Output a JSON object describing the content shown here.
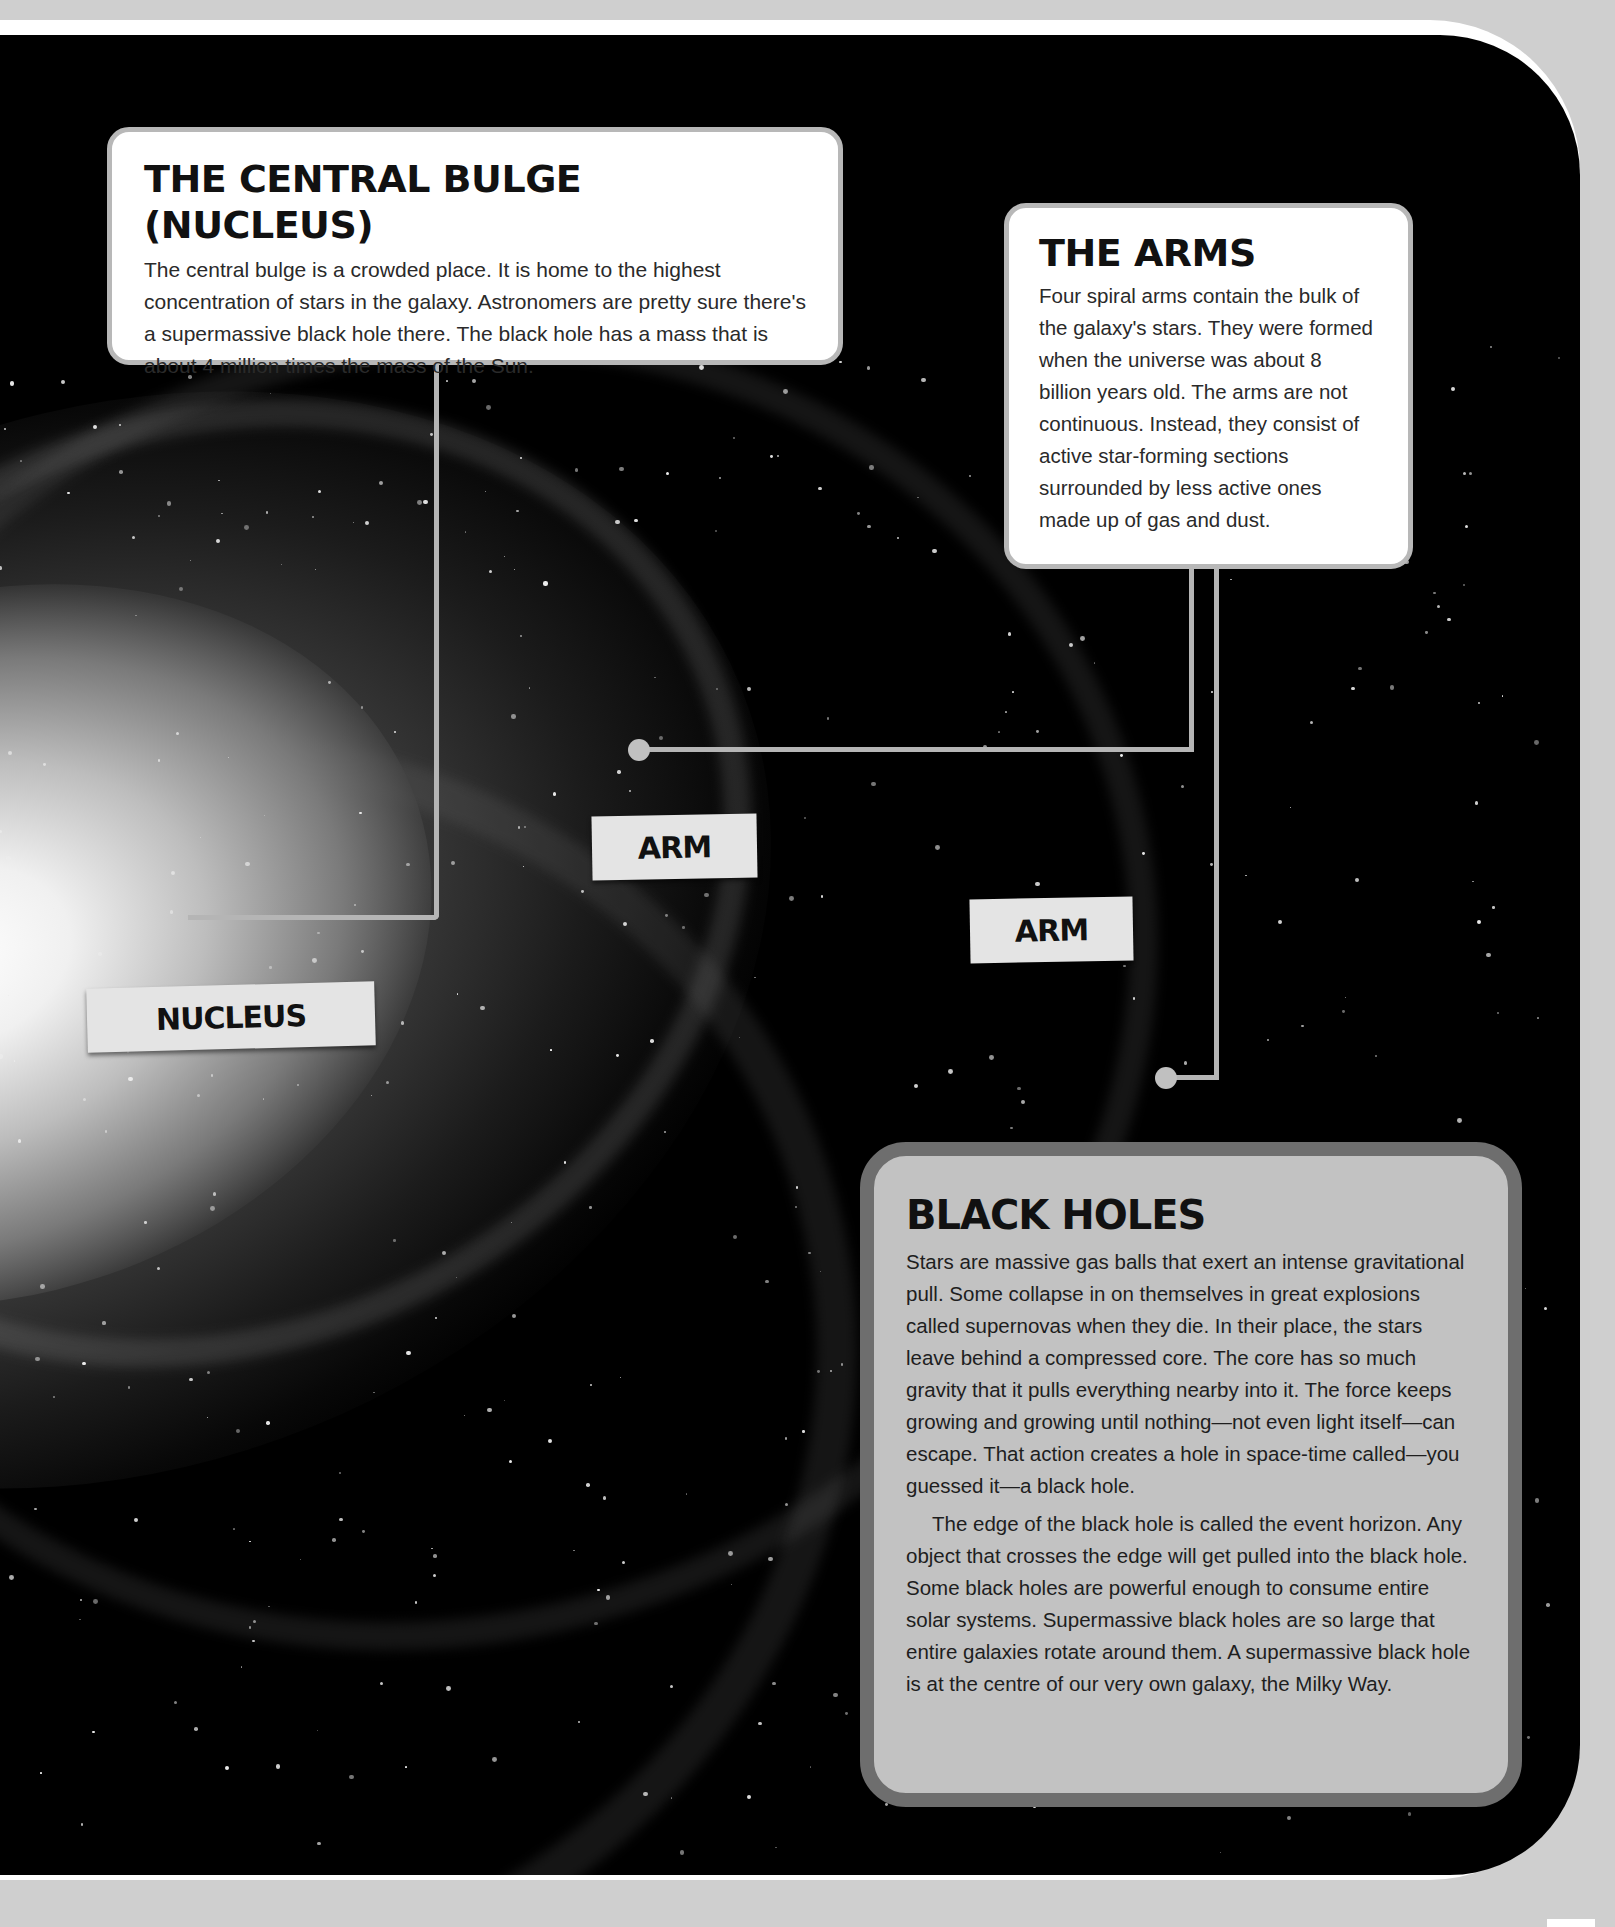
{
  "page": {
    "background_color": "#cfcfcf",
    "space_color": "#000000",
    "frame_color": "#ffffff"
  },
  "central_bulge": {
    "title": "THE CENTRAL BULGE (NUCLEUS)",
    "body": "The central bulge is a crowded place. It is home to the highest concentration of stars in the galaxy. Astronomers are pretty sure there's a supermassive black hole there. The black hole has a mass that is about 4 million times the mass of the Sun."
  },
  "arms": {
    "title": "THE ARMS",
    "body": "Four spiral arms contain the bulk of the galaxy's stars. They were formed when the universe was about 8 billion years old. The arms are not continuous. Instead, they consist of active star-forming sections surrounded by less active ones made up of gas and dust."
  },
  "black_holes": {
    "title": "BLACK HOLES",
    "paragraph_1": "Stars are massive gas balls that exert an intense gravitational pull. Some collapse in on themselves in great explosions called supernovas when they die. In their place, the stars leave behind a compressed core. The core has so much gravity that it pulls everything nearby into it. The force keeps growing and growing until nothing—not even light itself—can escape. That action creates a hole in space-time called—you guessed it—a black hole.",
    "paragraph_2": "The edge of the black hole is called the event horizon. Any object that crosses the edge will get pulled into the black hole. Some black holes are powerful enough to consume entire solar systems. Supermassive black holes are so large that entire galaxies rotate around them. A supermassive black hole is at the centre of our very own galaxy, the Milky Way.",
    "panel_color": "#c2c2c2",
    "border_color": "#6e6e6e"
  },
  "labels": {
    "nucleus": "NUCLEUS",
    "arm_1": "ARM",
    "arm_2": "ARM"
  }
}
